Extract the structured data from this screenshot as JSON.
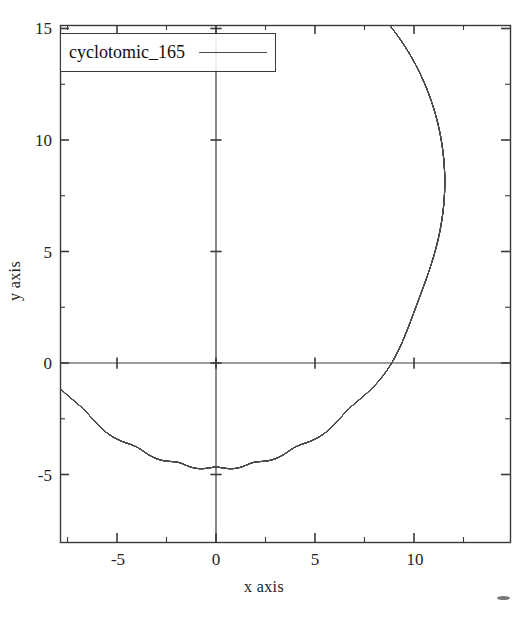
{
  "figure": {
    "background_color": "#ffffff",
    "frame_color": "#3a3a3a",
    "curve_color": "#4a4a4a"
  },
  "legend": {
    "entries": [
      {
        "label": "cyclotomic_165",
        "color": "#4a4a4a"
      }
    ]
  },
  "axes": {
    "x_title": "x axis",
    "y_title": "y axis",
    "x_major_labels": [
      "-5",
      "0",
      "5",
      "10"
    ],
    "y_major_labels": [
      "-5",
      "0",
      "5",
      "10",
      "15"
    ]
  },
  "chart_data": {
    "type": "line",
    "title": "",
    "subtitle": "",
    "xlabel": "x axis",
    "ylabel": "y axis",
    "xlim": [
      -7.75,
      14.9
    ],
    "ylim": [
      -6.2,
      15.3
    ],
    "xticks": [
      -5,
      0,
      5,
      10
    ],
    "yticks": [
      -5,
      0,
      5,
      10,
      15
    ],
    "xtick_labels": [
      "-5",
      "0",
      "5",
      "10"
    ],
    "ytick_labels": [
      "-5",
      "0",
      "5",
      "10",
      "15"
    ],
    "minor_tick_step": 2.5,
    "grid": false,
    "legend_position": "upper left",
    "legend_entries": [
      "cyclotomic_165"
    ],
    "annotations": [],
    "series": [
      {
        "name": "cyclotomic_165",
        "color": "#4a4a4a",
        "linewidth": 1,
        "parametric": true,
        "model": "sum_of_epicycles",
        "n_terms": 10,
        "t_range": [
          0,
          62.83185307179586
        ],
        "samples": 7000,
        "terms": [
          {
            "radius": 7.35,
            "frequency": 1,
            "phase": 1.5707963268
          },
          {
            "radius": 4.25,
            "frequency": 2,
            "phase": 1.5707963268
          },
          {
            "radius": 2.65,
            "frequency": 3,
            "phase": 1.5707963268
          },
          {
            "radius": 1.7,
            "frequency": 4,
            "phase": 1.5707963268
          },
          {
            "radius": 1.12,
            "frequency": 5,
            "phase": 1.5707963268
          },
          {
            "radius": 0.74,
            "frequency": 6,
            "phase": 1.5707963268
          },
          {
            "radius": 0.49,
            "frequency": 7,
            "phase": 1.5707963268
          },
          {
            "radius": 0.32,
            "frequency": 8,
            "phase": 1.5707963268
          },
          {
            "radius": 0.21,
            "frequency": 9,
            "phase": 1.5707963268
          },
          {
            "radius": 0.14,
            "frequency": 10,
            "phase": 1.5707963268
          }
        ],
        "extent": {
          "x_min": -7.0,
          "x_max": 14.0,
          "y_min": -6.0,
          "y_max": 13.9
        }
      }
    ]
  },
  "geometry": {
    "frame": {
      "left": 60,
      "top": 25,
      "right": 510,
      "bottom": 542
    },
    "origin": {
      "x": 216,
      "y": 363
    },
    "px_per_unit_x": 19.8,
    "px_per_unit_y": 22.3
  }
}
